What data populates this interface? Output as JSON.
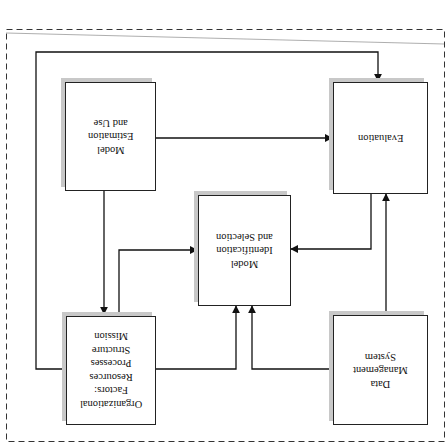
{
  "diagram": {
    "orientation": "rotated-180",
    "frame": {
      "style": "dashed",
      "color": "#333333"
    },
    "nodes": [
      {
        "id": "estimation",
        "label": "Model\nEstimation\nand Use"
      },
      {
        "id": "evaluation",
        "label": "Evaluation"
      },
      {
        "id": "identification",
        "label": "Model\nIdentification\nand Selection"
      },
      {
        "id": "organizational",
        "label": "Organizational\nFactors:\nResources\nProcesses\nStructure\nMission"
      },
      {
        "id": "data",
        "label": "Data\nManagement\nSystem"
      }
    ],
    "edges": [
      {
        "from": "estimation",
        "to": "evaluation"
      },
      {
        "from": "estimation",
        "to": "organizational"
      },
      {
        "from": "organizational",
        "to": "identification"
      },
      {
        "from": "organizational",
        "to": "evaluation",
        "note": "outer loop"
      },
      {
        "from": "evaluation",
        "to": "identification"
      },
      {
        "from": "data",
        "to": "identification"
      },
      {
        "from": "data",
        "to": "evaluation"
      }
    ]
  }
}
